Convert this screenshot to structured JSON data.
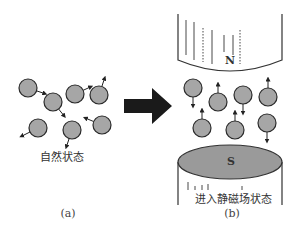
{
  "panels": {
    "a": {
      "label": "自然状态",
      "caption": "(a)",
      "state": "natural, random spin orientations"
    },
    "b": {
      "label": "进入静磁场状态",
      "caption": "(b)",
      "magnet_top_pole": "N",
      "magnet_bottom_pole": "S",
      "state": "aligned parallel / antiparallel with static magnetic field"
    }
  },
  "arrow": {
    "direction": "right",
    "color": "#1a1a1a"
  },
  "colors": {
    "particle_fill": "#a6a6a6",
    "particle_stroke": "#2a2a2a",
    "s_pole_fill": "#9a9a9a",
    "line": "#333333"
  },
  "particles_a": [
    {
      "cx": 28,
      "cy": 88,
      "dx": 12,
      "dy": 4
    },
    {
      "cx": 53,
      "cy": 102,
      "dx": 8,
      "dy": 10
    },
    {
      "cx": 75,
      "cy": 94,
      "dx": 11,
      "dy": -5
    },
    {
      "cx": 99,
      "cy": 95,
      "dx": 4,
      "dy": -12
    },
    {
      "cx": 38,
      "cy": 128,
      "dx": -12,
      "dy": 6
    },
    {
      "cx": 72,
      "cy": 130,
      "dx": -4,
      "dy": 12
    },
    {
      "cx": 102,
      "cy": 125,
      "dx": -12,
      "dy": -5
    }
  ],
  "particles_b": [
    {
      "cx": 193,
      "cy": 88,
      "dir": "down"
    },
    {
      "cx": 218,
      "cy": 102,
      "dir": "up"
    },
    {
      "cx": 243,
      "cy": 95,
      "dir": "down"
    },
    {
      "cx": 268,
      "cy": 97,
      "dir": "up"
    },
    {
      "cx": 202,
      "cy": 128,
      "dir": "up"
    },
    {
      "cx": 235,
      "cy": 130,
      "dir": "up"
    },
    {
      "cx": 267,
      "cy": 123,
      "dir": "down"
    }
  ]
}
